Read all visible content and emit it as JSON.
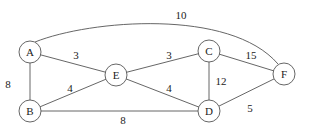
{
  "graph": {
    "nodes": [
      {
        "id": "A",
        "label": "A",
        "x": 30,
        "y": 52
      },
      {
        "id": "B",
        "label": "B",
        "x": 30,
        "y": 111
      },
      {
        "id": "E",
        "label": "E",
        "x": 116,
        "y": 75
      },
      {
        "id": "C",
        "label": "C",
        "x": 209,
        "y": 51
      },
      {
        "id": "D",
        "label": "D",
        "x": 209,
        "y": 111
      },
      {
        "id": "F",
        "label": "F",
        "x": 284,
        "y": 74
      }
    ],
    "edges": [
      {
        "from": "A",
        "to": "B",
        "weight": "8",
        "label_x": 8,
        "label_y": 84
      },
      {
        "from": "A",
        "to": "E",
        "weight": "3",
        "label_x": 76,
        "label_y": 55
      },
      {
        "from": "B",
        "to": "E",
        "weight": "4",
        "label_x": 70,
        "label_y": 88
      },
      {
        "from": "B",
        "to": "D",
        "weight": "8",
        "label_x": 123,
        "label_y": 120
      },
      {
        "from": "E",
        "to": "C",
        "weight": "3",
        "label_x": 169,
        "label_y": 55
      },
      {
        "from": "E",
        "to": "D",
        "weight": "4",
        "label_x": 169,
        "label_y": 88
      },
      {
        "from": "C",
        "to": "D",
        "weight": "12",
        "label_x": 221,
        "label_y": 81
      },
      {
        "from": "C",
        "to": "F",
        "weight": "15",
        "label_x": 251,
        "label_y": 55
      },
      {
        "from": "D",
        "to": "F",
        "weight": "5",
        "label_x": 250,
        "label_y": 108
      },
      {
        "from": "A",
        "to": "F",
        "weight": "10",
        "label_x": 181,
        "label_y": 15,
        "curved": true
      }
    ]
  }
}
